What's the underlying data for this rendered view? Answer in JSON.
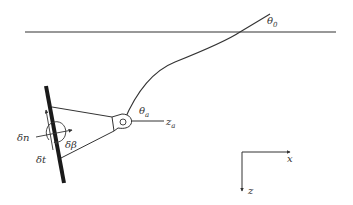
{
  "labels": {
    "theta0": "θ",
    "theta0_sub": "0",
    "theta_a": "θ",
    "theta_a_sub": "a",
    "z_a": "z",
    "z_a_sub": "a",
    "delta_n": "δn",
    "delta_t": "δt",
    "delta_beta": "δβ",
    "axis_x": "x",
    "axis_z": "z"
  },
  "colors": {
    "stroke": "#333333",
    "plate": "#1a1a1a",
    "background": "#ffffff"
  }
}
